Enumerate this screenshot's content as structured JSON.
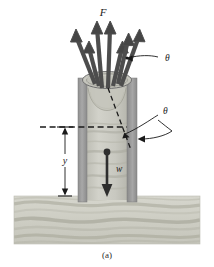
{
  "figure": {
    "caption": "(a)",
    "labels": {
      "force": "F",
      "theta_upper": "θ",
      "theta_lower": "θ",
      "depth": "y",
      "weight": "w"
    },
    "colors": {
      "arrow": "#4d4d4d",
      "arrow_dark": "#3a3a3a",
      "tube_wall": "#9a9a9a",
      "tube_wall_light": "#b4b4b4",
      "soil_plug": "#c9c9c0",
      "ground_base": "#cfcfc6",
      "ground_band": "#b0b0a4",
      "line": "#1a1a1a",
      "background": "#ffffff"
    },
    "elements": {
      "force_arrow_count": 7,
      "tube_label": "cylindrical-tube",
      "soil_label": "soil-plug",
      "ground_label": "sediment-ground",
      "weight_arrow_label": "weight-arrow-w",
      "depth_dimension_label": "depth-dimension-y",
      "angle_dashed_line_label": "failure-plane-dashed-line"
    }
  }
}
